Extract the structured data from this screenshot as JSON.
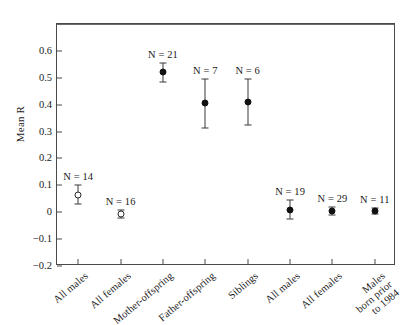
{
  "chart_data": {
    "type": "scatter",
    "title": "",
    "xlabel": "",
    "ylabel": "Mean R",
    "ylim": [
      -0.2,
      0.7
    ],
    "ytick_values": [
      0.6,
      0.5,
      0.4,
      0.3,
      0.2,
      0.1,
      0,
      -0.1,
      -0.2
    ],
    "ytick_labels": [
      "0.6",
      "0.5",
      "0.4",
      "0.3",
      "0.2",
      "0.1",
      "0",
      "−0.1",
      "−0.2"
    ],
    "grid": false,
    "legend": "none",
    "zero_reference_line": 0,
    "categories": [
      "All males",
      "All females",
      "Mother-offspring",
      "Father-offspring",
      "Siblings",
      "All males",
      "All females",
      "Males born prior to 1984"
    ],
    "category_label_lines": [
      [
        "All males"
      ],
      [
        "All females"
      ],
      [
        "Mother-offspring"
      ],
      [
        "Father-offspring"
      ],
      [
        "Siblings"
      ],
      [
        "All males"
      ],
      [
        "All females"
      ],
      [
        "Males",
        "born prior",
        "to 1984"
      ]
    ],
    "values": [
      0.065,
      -0.005,
      0.52,
      0.405,
      0.41,
      0.01,
      0.005,
      0.005
    ],
    "errors": [
      0.035,
      0.015,
      0.035,
      0.09,
      0.085,
      0.035,
      0.014,
      0.012
    ],
    "marker_styles": [
      "open",
      "open",
      "filled",
      "filled",
      "filled",
      "filled",
      "filled",
      "filled"
    ],
    "n_values": [
      14,
      16,
      21,
      7,
      6,
      19,
      29,
      11
    ],
    "point_labels": [
      "N = 14",
      "N = 16",
      "N = 21",
      "N = 7",
      "N = 6",
      "N = 19",
      "N = 29",
      "N = 11"
    ],
    "colors": {
      "marker_fill": "#111111",
      "marker_edge": "#2b2b2b",
      "axis": "#4a4a4a",
      "zero_line": "#6b6b6b",
      "background": "#ffffff"
    }
  }
}
